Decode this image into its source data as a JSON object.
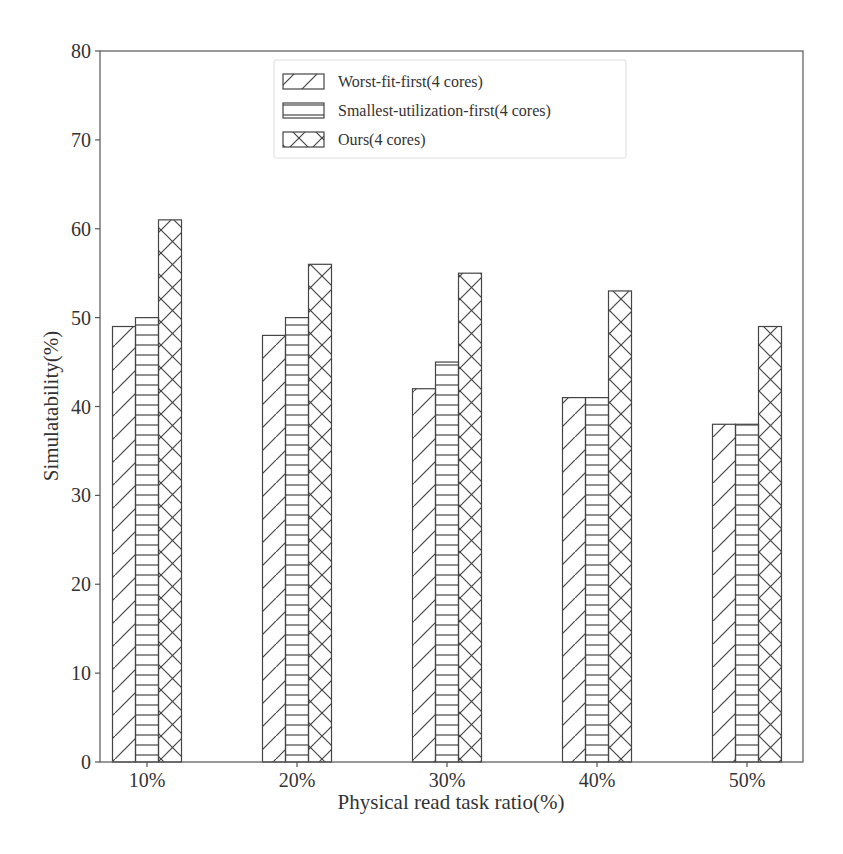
{
  "chart_data": {
    "type": "bar",
    "title": "",
    "xlabel": "Physical read task ratio(%)",
    "ylabel": "Simulatability(%)",
    "categories": [
      "10%",
      "20%",
      "30%",
      "40%",
      "50%"
    ],
    "series": [
      {
        "name": "Worst-fit-first(4 cores)",
        "hatch": "diagonal",
        "values": [
          49,
          48,
          42,
          41,
          38
        ]
      },
      {
        "name": "Smallest-utilization-first(4 cores)",
        "hatch": "horizontal",
        "values": [
          50,
          50,
          45,
          41,
          38
        ]
      },
      {
        "name": "Ours(4 cores)",
        "hatch": "crosshatch",
        "values": [
          61,
          56,
          55,
          53,
          49
        ]
      }
    ],
    "ylim": [
      0,
      80
    ],
    "yticks": [
      0,
      10,
      20,
      30,
      40,
      50,
      60,
      70,
      80
    ],
    "grid": false,
    "legend_position": "upper center"
  },
  "colors": {
    "edge": "#444444",
    "background": "#ffffff",
    "axis": "#555555"
  }
}
